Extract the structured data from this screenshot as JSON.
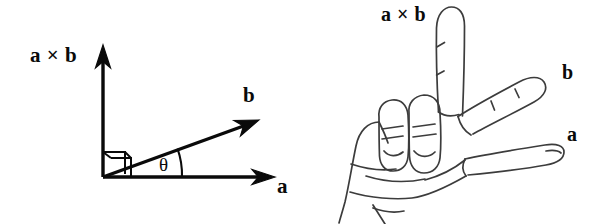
{
  "figure": {
    "background_color": "#ffffff",
    "ink_color": "#0a0a0a",
    "hand_line_color": "#3c3c3c",
    "width": 603,
    "height": 224
  },
  "vector_diagram": {
    "name": "cross-product-vector-diagram",
    "labels": {
      "cross_product": "a × b",
      "vector_b": "b",
      "vector_a": "a",
      "angle": "θ"
    },
    "axes": {
      "vertical_axis_label": "a × b",
      "horizontal_axis_label": "a",
      "diagonal_vector_label": "b"
    },
    "markers": {
      "right_angle_marker": "right-angle-square",
      "angle_arc": "theta-arc"
    },
    "geometry": {
      "origin": [
        103,
        177
      ],
      "vertical_tip": [
        103,
        48
      ],
      "horizontal_tip": [
        272,
        177
      ],
      "b_tip": [
        256,
        121
      ],
      "b_angle_degrees": 20
    }
  },
  "hand_diagram": {
    "name": "right-hand-rule-illustration",
    "labels": {
      "middle_finger": "a × b",
      "index_finger": "b",
      "thumb": "a"
    },
    "description": "Right hand with thumb, index finger and middle finger mutually perpendicular",
    "parts": [
      {
        "name": "middle-finger",
        "label": "a × b",
        "direction": "up"
      },
      {
        "name": "index-finger",
        "label": "b",
        "direction": "up-right"
      },
      {
        "name": "thumb",
        "label": "a",
        "direction": "right"
      },
      {
        "name": "ring-finger",
        "label": "",
        "direction": "folded"
      },
      {
        "name": "pinky-finger",
        "label": "",
        "direction": "folded"
      },
      {
        "name": "palm",
        "label": "",
        "direction": ""
      }
    ]
  }
}
